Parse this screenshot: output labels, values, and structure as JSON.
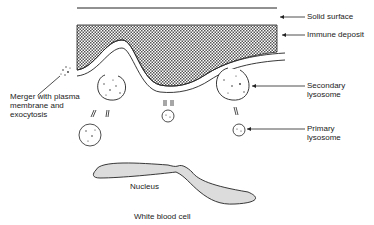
{
  "diagram": {
    "labels": {
      "solid_surface": "Solid surface",
      "immune_deposit": "Immune deposit",
      "secondary_lysosome": "Secondary\nlysosome",
      "primary_lysosome": "Primary\nlysosome",
      "merger": "Merger with plasma\nmembrane and\nexocytosis",
      "nucleus": "Nucleus",
      "white_blood_cell": "White blood cell"
    },
    "colors": {
      "line": "#222222",
      "hatch": "#555555",
      "nucleus_fill": "#dcdcdc"
    }
  }
}
